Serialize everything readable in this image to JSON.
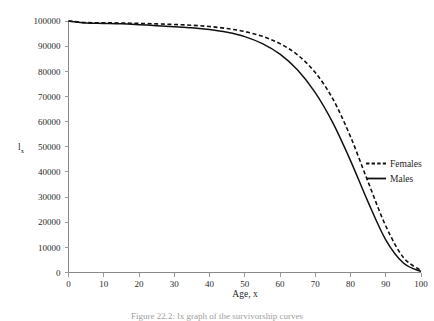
{
  "chart_data": {
    "type": "line",
    "title": "",
    "xlabel": "Age, x",
    "ylabel": "l",
    "ylabel_subscript": "x",
    "xlim": [
      0,
      100
    ],
    "ylim": [
      0,
      100000
    ],
    "grid": false,
    "legend_position": "right-middle",
    "xticks": [
      "0",
      "10",
      "20",
      "30",
      "40",
      "50",
      "60",
      "70",
      "80",
      "90",
      "100"
    ],
    "yticks": [
      "0",
      "10000",
      "20000",
      "30000",
      "40000",
      "50000",
      "60000",
      "70000",
      "80000",
      "90000",
      "100000"
    ],
    "x": [
      0,
      5,
      10,
      15,
      20,
      25,
      30,
      35,
      40,
      45,
      50,
      55,
      60,
      65,
      70,
      75,
      80,
      85,
      90,
      95,
      100
    ],
    "series": [
      {
        "name": "Females",
        "style": "dashed",
        "color": "#111111",
        "values": [
          100000,
          99400,
          99300,
          99200,
          99050,
          98850,
          98600,
          98300,
          97800,
          97000,
          95800,
          93900,
          91000,
          86500,
          79500,
          69000,
          54000,
          36000,
          18500,
          6000,
          800
        ]
      },
      {
        "name": "Males",
        "style": "solid",
        "color": "#111111",
        "values": [
          100000,
          99200,
          99050,
          98900,
          98550,
          98150,
          97750,
          97300,
          96600,
          95500,
          93800,
          91000,
          86800,
          80500,
          71500,
          59500,
          44500,
          28000,
          13000,
          3800,
          400
        ]
      }
    ],
    "legend": [
      {
        "label": "Females",
        "style": "dashed"
      },
      {
        "label": "Males",
        "style": "solid"
      }
    ]
  },
  "caption": {
    "text": "Figure 22.2: lx graph of the survivorship curves"
  }
}
